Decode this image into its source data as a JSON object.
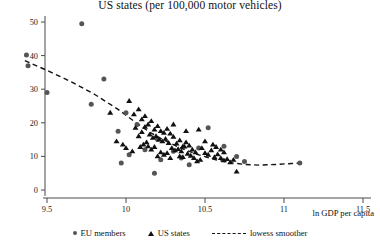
{
  "chart_data": {
    "type": "scatter",
    "title": "US states (per 100,000 motor vehicles)",
    "xlabel": "ln GDP per capita",
    "ylabel": "",
    "xlim": [
      9.3,
      11.6
    ],
    "ylim": [
      -2,
      53
    ],
    "xticks": [
      9.5,
      10,
      10.5,
      11,
      11.5
    ],
    "xtick_labels": [
      "9.5",
      "10",
      "10.5",
      "11",
      "11.5"
    ],
    "yticks": [
      0,
      10,
      20,
      30,
      40,
      50
    ],
    "ytick_labels": [
      "0",
      "10",
      "20",
      "30",
      "40",
      "50"
    ],
    "grid": false,
    "legend_position": "bottom",
    "series": [
      {
        "name": "EU members",
        "marker": "circle",
        "color": "#555555",
        "points": [
          [
            9.37,
            40.2
          ],
          [
            9.38,
            37.0
          ],
          [
            9.5,
            29.0
          ],
          [
            9.72,
            49.5
          ],
          [
            9.86,
            33.0
          ],
          [
            9.78,
            25.5
          ],
          [
            10.0,
            23.0
          ],
          [
            9.95,
            17.5
          ],
          [
            10.07,
            19.5
          ],
          [
            10.2,
            15.0
          ],
          [
            10.12,
            12.0
          ],
          [
            10.02,
            10.5
          ],
          [
            9.97,
            8.0
          ],
          [
            10.22,
            9.0
          ],
          [
            10.3,
            11.5
          ],
          [
            10.35,
            9.5
          ],
          [
            10.18,
            5.0
          ],
          [
            10.52,
            18.5
          ],
          [
            10.62,
            13.0
          ],
          [
            10.7,
            10.0
          ],
          [
            10.75,
            8.5
          ],
          [
            11.1,
            8.0
          ],
          [
            10.46,
            12.5
          ],
          [
            10.4,
            7.5
          ]
        ]
      },
      {
        "name": "US states",
        "marker": "triangle",
        "color": "#111111",
        "points": [
          [
            9.9,
            23.0
          ],
          [
            10.02,
            26.5
          ],
          [
            10.05,
            22.5
          ],
          [
            10.08,
            24.0
          ],
          [
            10.1,
            21.0
          ],
          [
            10.12,
            22.0
          ],
          [
            10.14,
            19.5
          ],
          [
            10.16,
            20.5
          ],
          [
            10.06,
            18.5
          ],
          [
            10.18,
            18.0
          ],
          [
            10.2,
            19.0
          ],
          [
            10.22,
            17.5
          ],
          [
            10.24,
            17.0
          ],
          [
            10.26,
            18.2
          ],
          [
            10.15,
            16.5
          ],
          [
            10.17,
            15.5
          ],
          [
            10.19,
            16.0
          ],
          [
            10.21,
            15.0
          ],
          [
            10.23,
            14.5
          ],
          [
            10.25,
            15.2
          ],
          [
            10.27,
            14.0
          ],
          [
            10.28,
            16.8
          ],
          [
            10.3,
            15.8
          ],
          [
            10.13,
            14.2
          ],
          [
            10.11,
            13.5
          ],
          [
            10.09,
            12.8
          ],
          [
            10.32,
            13.8
          ],
          [
            10.34,
            14.8
          ],
          [
            10.36,
            13.0
          ],
          [
            10.29,
            12.5
          ],
          [
            10.31,
            11.8
          ],
          [
            10.33,
            12.2
          ],
          [
            10.35,
            11.5
          ],
          [
            10.37,
            12.9
          ],
          [
            10.38,
            14.2
          ],
          [
            10.4,
            13.2
          ],
          [
            10.42,
            12.0
          ],
          [
            10.44,
            11.2
          ],
          [
            10.39,
            10.8
          ],
          [
            10.41,
            10.2
          ],
          [
            10.26,
            11.0
          ],
          [
            10.24,
            10.5
          ],
          [
            10.22,
            11.2
          ],
          [
            10.2,
            10.0
          ],
          [
            10.04,
            11.5
          ],
          [
            10.0,
            12.5
          ],
          [
            9.98,
            13.5
          ],
          [
            10.46,
            18.0
          ],
          [
            10.3,
            19.5
          ],
          [
            10.38,
            17.5
          ],
          [
            10.48,
            12.5
          ],
          [
            10.5,
            11.0
          ],
          [
            10.52,
            10.5
          ],
          [
            10.54,
            11.8
          ],
          [
            10.56,
            9.8
          ],
          [
            10.58,
            10.6
          ],
          [
            10.6,
            9.5
          ],
          [
            10.62,
            8.8
          ],
          [
            10.64,
            9.2
          ],
          [
            10.66,
            8.2
          ],
          [
            10.68,
            9.0
          ],
          [
            10.55,
            13.5
          ],
          [
            10.57,
            12.8
          ],
          [
            10.7,
            5.5
          ],
          [
            10.47,
            9.0
          ],
          [
            10.45,
            8.5
          ],
          [
            10.43,
            9.5
          ],
          [
            10.08,
            16.0
          ],
          [
            10.1,
            17.2
          ],
          [
            10.12,
            18.8
          ],
          [
            10.14,
            13.0
          ],
          [
            10.16,
            12.0
          ],
          [
            10.18,
            12.8
          ],
          [
            10.36,
            9.8
          ],
          [
            10.34,
            10.0
          ],
          [
            9.94,
            14.5
          ],
          [
            10.6,
            12.0
          ],
          [
            10.62,
            11.2
          ],
          [
            10.5,
            14.5
          ],
          [
            10.28,
            9.5
          ]
        ]
      },
      {
        "name": "lowess smoother",
        "marker": "dashed-line",
        "color": "#111111",
        "points": [
          [
            9.36,
            38.5
          ],
          [
            9.5,
            35.6
          ],
          [
            9.65,
            32.3
          ],
          [
            9.8,
            28.5
          ],
          [
            9.95,
            24.0
          ],
          [
            10.05,
            20.5
          ],
          [
            10.15,
            17.2
          ],
          [
            10.25,
            14.6
          ],
          [
            10.35,
            12.4
          ],
          [
            10.45,
            10.6
          ],
          [
            10.55,
            9.2
          ],
          [
            10.65,
            8.2
          ],
          [
            10.75,
            7.6
          ],
          [
            10.85,
            7.4
          ],
          [
            10.95,
            7.6
          ],
          [
            11.05,
            7.9
          ],
          [
            11.1,
            8.0
          ]
        ]
      }
    ]
  },
  "legend": {
    "items": [
      {
        "label": "EU members"
      },
      {
        "label": "US states"
      },
      {
        "label": "lowess smoother"
      }
    ]
  }
}
